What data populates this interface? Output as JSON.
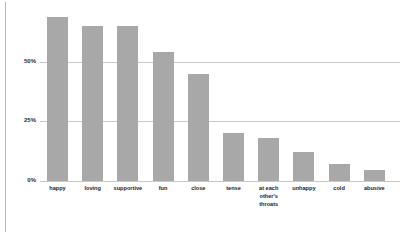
{
  "chart_data": {
    "type": "bar",
    "title": "",
    "subtitle": "",
    "xlabel": "",
    "ylabel": "",
    "categories": [
      "happy",
      "loving",
      "supportive",
      "fun",
      "close",
      "tense",
      "at each\nother's\nthroats",
      "unhappy",
      "cold",
      "abusive"
    ],
    "values": [
      69,
      65,
      65,
      54,
      45,
      20,
      18,
      12,
      7,
      4.5
    ],
    "value_unit": "%",
    "ylim": [
      0,
      75
    ],
    "yticks": [
      0,
      25,
      50
    ],
    "ytick_labels": [
      "0%",
      "25%",
      "50%"
    ],
    "grid": true,
    "gridlines_at": [
      25,
      50
    ],
    "legend": "none",
    "bar_color": "#a8a8a8",
    "gridline_color": "#c8c8c8",
    "text_color": "#1d1d1d",
    "background_color": "#ffffff",
    "frame_color": "#b9b9b9"
  },
  "axis": {
    "y": {
      "tick_0": "0%",
      "tick_25": "25%",
      "tick_50": "50%"
    }
  }
}
